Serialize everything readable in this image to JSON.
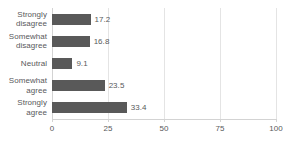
{
  "chart_data": {
    "type": "bar",
    "orientation": "horizontal",
    "title": "",
    "xlabel": "",
    "ylabel": "",
    "categories": [
      "Strongly\ndisagree",
      "Somewhat\ndisagree",
      "Neutral",
      "Somewhat\nagree",
      "Strongly\nagree"
    ],
    "values": [
      17.2,
      16.8,
      9.1,
      23.5,
      33.4
    ],
    "data_labels": [
      "17.2",
      "16.8",
      "9.1",
      "23.5",
      "33.4"
    ],
    "xlim": [
      0,
      100
    ],
    "xticks": [
      0,
      25,
      50,
      75,
      100
    ],
    "xtick_labels": [
      "0",
      "25",
      "50",
      "75",
      "100"
    ],
    "grid": "vertical",
    "legend": "none",
    "bar_color": "#595959",
    "gridline_color": "#e4e4e4",
    "axis_color": "#d3d3d3",
    "text_color": "#58595b"
  }
}
